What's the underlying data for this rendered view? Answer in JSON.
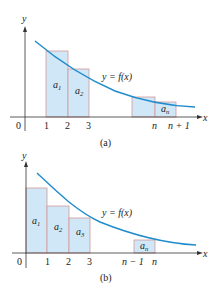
{
  "colors": {
    "curve": "#1f8ccc",
    "bar_fill": "#cfe7f6",
    "bar_stroke": "#d59a98",
    "axis": "#333333"
  },
  "panel_a": {
    "caption": "(a)",
    "axis_x_label": "x",
    "axis_y_label": "y",
    "curve_label": "y = f(x)",
    "tick_labels": [
      "0",
      "1",
      "2",
      "3",
      "n",
      "n + 1"
    ],
    "bars": [
      {
        "label": "a",
        "sub": "1"
      },
      {
        "label": "a",
        "sub": "2"
      },
      {
        "label": "",
        "sub": ""
      },
      {
        "label": "a",
        "sub": "n"
      }
    ]
  },
  "panel_b": {
    "caption": "(b)",
    "axis_x_label": "x",
    "axis_y_label": "y",
    "curve_label": "y = f(x)",
    "tick_labels": [
      "0",
      "1",
      "2",
      "3",
      "n − 1",
      "n"
    ],
    "bars": [
      {
        "label": "a",
        "sub": "1"
      },
      {
        "label": "a",
        "sub": "2"
      },
      {
        "label": "a",
        "sub": "3"
      },
      {
        "label": "a",
        "sub": "n"
      }
    ]
  }
}
